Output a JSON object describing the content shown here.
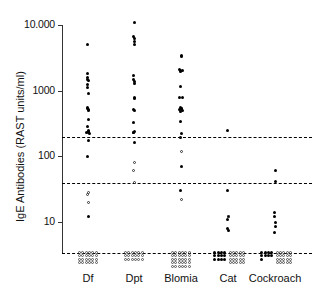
{
  "chart_data": {
    "type": "scatter",
    "title": "",
    "xlabel": "",
    "ylabel": "IgE Antibodies (RAST units/ml)",
    "yscale": "log",
    "ylim": [
      3,
      14000
    ],
    "ytick_labels": [
      "10.000",
      "1000",
      "100",
      "10"
    ],
    "ytick_values": [
      10000,
      1000,
      100,
      10
    ],
    "categories": [
      "Df",
      "Dpt",
      "Blomia",
      "Cat",
      "Cockroach"
    ],
    "grid": false,
    "legend": "none",
    "reference_lines": [
      {
        "value": 200,
        "style": "dashed-short"
      },
      {
        "value": 40,
        "style": "dashed-long"
      },
      {
        "value": 4.5,
        "style": "dashed-baseline"
      }
    ],
    "marker_styles": [
      "filled-circle",
      "open-circle"
    ],
    "series": [
      {
        "name": "Df",
        "filled": [
          5000,
          1800,
          1600,
          1500,
          1450,
          1250,
          1100,
          900,
          560,
          540,
          520,
          500,
          360,
          290,
          250,
          240,
          235,
          230,
          225,
          175,
          100,
          12
        ],
        "open": [
          28,
          26,
          20
        ],
        "below_detection_count": 24
      },
      {
        "name": "Dpt",
        "filled": [
          11000,
          6800,
          6200,
          5600,
          5000,
          1700,
          1500,
          1400,
          1300,
          800,
          760,
          520,
          500,
          330,
          240,
          235,
          230,
          160
        ],
        "open": [
          80,
          62,
          40
        ],
        "below_detection_count": 18
      },
      {
        "name": "Blomia",
        "filled": [
          3400,
          3300,
          2100,
          2050,
          2000,
          1950,
          1150,
          800,
          790,
          560,
          545,
          530,
          515,
          500,
          480,
          340,
          225,
          195,
          70,
          30
        ],
        "open": [
          120,
          22
        ],
        "below_detection_count": 30
      },
      {
        "name": "Cat",
        "filled": [
          250,
          30,
          12,
          11,
          8,
          7.5
        ],
        "open": [
          12
        ],
        "below_detection_solid_count": 12,
        "below_detection_open_count": 20
      },
      {
        "name": "Cockroach",
        "filled": [
          60,
          42,
          14,
          12,
          10,
          8.5,
          7
        ],
        "open": [],
        "below_detection_solid_count": 9,
        "below_detection_open_count": 20
      }
    ]
  }
}
